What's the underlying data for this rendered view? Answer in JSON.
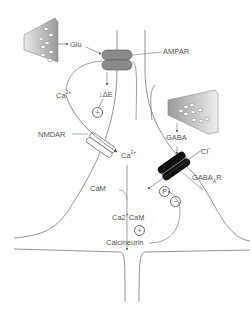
{
  "diagram": {
    "labels": {
      "glu": "Glu",
      "ampar": "AMPAR",
      "ca_top": "Ca",
      "ca_top_sup": "2+",
      "delta_e": "ΔE",
      "nmdar": "NMDAR",
      "ca_mid": "Ca",
      "ca_mid_sup": "2+",
      "gaba": "GABA",
      "cl": "Cl",
      "cl_sup": "−",
      "gabaar": "GABA",
      "gabaar_sub": "A",
      "gabaar_suffix": "R",
      "cam": "CaM",
      "ca2cam": "Ca2",
      "ca2cam_sup": "+",
      "ca2cam_suffix": "CaM",
      "calcineurin": "Calcineurin"
    },
    "symbols": {
      "plus_top": "+",
      "plus_bottom": "+",
      "minus": "−",
      "phosphate": "P"
    },
    "colors": {
      "line": "#777777",
      "ampar": "#8a8a8a",
      "gabaar": "#111111",
      "terminal": "#b5b5b5"
    }
  }
}
